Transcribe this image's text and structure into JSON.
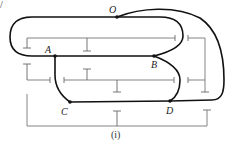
{
  "diagram": {
    "corner_mark": "/",
    "points": {
      "O": "O",
      "A": "A",
      "B": "B",
      "C": "C",
      "D": "D"
    },
    "caption": "(i)",
    "colors": {
      "thick_path": "#111111",
      "thin_lines": "#777777",
      "background": "#ffffff"
    }
  }
}
